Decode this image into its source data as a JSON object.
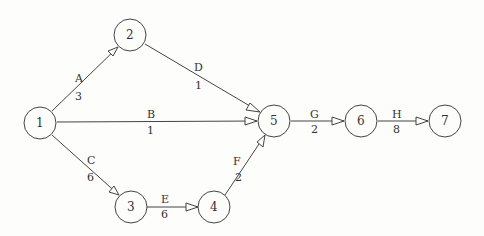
{
  "diagram": {
    "type": "activity-on-arrow network",
    "nodes": [
      {
        "id": "1",
        "label": "1",
        "x": 40,
        "y": 123
      },
      {
        "id": "2",
        "label": "2",
        "x": 130,
        "y": 35
      },
      {
        "id": "3",
        "label": "3",
        "x": 131,
        "y": 207
      },
      {
        "id": "4",
        "label": "4",
        "x": 214,
        "y": 207
      },
      {
        "id": "5",
        "label": "5",
        "x": 274,
        "y": 121
      },
      {
        "id": "6",
        "label": "6",
        "x": 361,
        "y": 121
      },
      {
        "id": "7",
        "label": "7",
        "x": 445,
        "y": 121
      }
    ],
    "edges": [
      {
        "from": "1",
        "to": "2",
        "activity": "A",
        "duration": "3"
      },
      {
        "from": "1",
        "to": "5",
        "activity": "B",
        "duration": "1"
      },
      {
        "from": "1",
        "to": "3",
        "activity": "C",
        "duration": "6"
      },
      {
        "from": "2",
        "to": "5",
        "activity": "D",
        "duration": "1"
      },
      {
        "from": "3",
        "to": "4",
        "activity": "E",
        "duration": "6"
      },
      {
        "from": "4",
        "to": "5",
        "activity": "F",
        "duration": "2"
      },
      {
        "from": "5",
        "to": "6",
        "activity": "G",
        "duration": "2"
      },
      {
        "from": "6",
        "to": "7",
        "activity": "H",
        "duration": "8"
      }
    ]
  }
}
